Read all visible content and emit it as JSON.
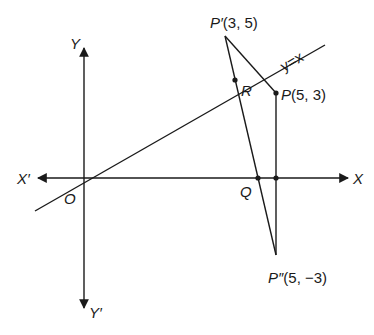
{
  "diagram": {
    "type": "coordinate-geometry-reflection",
    "axes": {
      "x_positive_label": "X",
      "x_negative_label": "X′",
      "y_positive_label": "Y",
      "y_negative_label": "Y′",
      "origin_label": "O"
    },
    "line": {
      "label": "y=x"
    },
    "points": {
      "P": {
        "name": "P",
        "coords": "(5, 3)"
      },
      "P_prime": {
        "name": "P′",
        "coords": "(3, 5)"
      },
      "P_double_prime": {
        "name": "P″",
        "coords": "(5, −3)"
      },
      "R": {
        "name": "R"
      },
      "Q": {
        "name": "Q"
      }
    },
    "segments": [
      "P′P″",
      "P′P",
      "PP″"
    ]
  }
}
